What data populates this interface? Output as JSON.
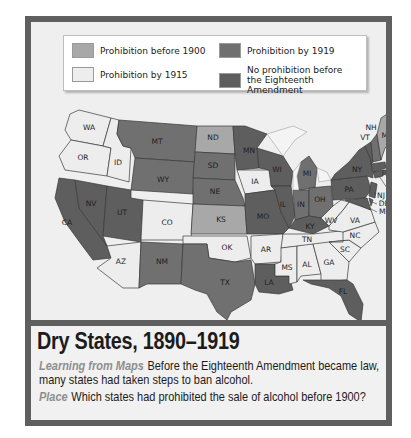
{
  "legend": {
    "items": [
      {
        "label": "Prohibition before 1900",
        "color": "#a8a8a8"
      },
      {
        "label": "Prohibition by 1915",
        "color": "#ededed"
      },
      {
        "label": "Prohibition by 1919",
        "color": "#707070"
      },
      {
        "label": "No prohibition before the Eighteenth Amendment",
        "color": "#5e5e5e"
      }
    ]
  },
  "map": {
    "states": {
      "WA": "Prohibition by 1915",
      "OR": "Prohibition by 1915",
      "ID": "Prohibition by 1915",
      "MT": "Prohibition by 1919",
      "WY": "Prohibition by 1919",
      "UT": "Prohibition by 1919",
      "NV": "No prohibition before the Eighteenth Amendment",
      "CA": "No prohibition before the Eighteenth Amendment",
      "AZ": "Prohibition by 1915",
      "CO": "Prohibition by 1915",
      "NM": "Prohibition by 1919",
      "ND": "Prohibition before 1900",
      "SD": "Prohibition by 1919",
      "NE": "Prohibition by 1919",
      "KS": "Prohibition before 1900",
      "OK": "Prohibition by 1915",
      "TX": "Prohibition by 1919",
      "MN": "No prohibition before the Eighteenth Amendment",
      "IA": "Prohibition by 1915",
      "MO": "No prohibition before the Eighteenth Amendment",
      "AR": "Prohibition by 1915",
      "LA": "No prohibition before the Eighteenth Amendment",
      "WI": "No prohibition before the Eighteenth Amendment",
      "IL": "No prohibition before the Eighteenth Amendment",
      "MI": "Prohibition by 1919",
      "IN": "Prohibition by 1919",
      "OH": "Prohibition by 1919",
      "KY": "No prohibition before the Eighteenth Amendment",
      "TN": "Prohibition by 1915",
      "MS": "Prohibition by 1915",
      "AL": "Prohibition by 1915",
      "GA": "Prohibition by 1915",
      "FL": "No prohibition before the Eighteenth Amendment",
      "SC": "Prohibition by 1915",
      "NC": "Prohibition by 1915",
      "VA": "Prohibition by 1915",
      "WV": "Prohibition by 1915",
      "PA": "No prohibition before the Eighteenth Amendment",
      "NY": "No prohibition before the Eighteenth Amendment",
      "NJ": "No prohibition before the Eighteenth Amendment",
      "DE": "No prohibition before the Eighteenth Amendment",
      "MD": "No prohibition before the Eighteenth Amendment",
      "CT": "No prohibition before the Eighteenth Amendment",
      "RI": "No prohibition before the Eighteenth Amendment",
      "MA": "No prohibition before the Eighteenth Amendment",
      "VT": "No prohibition before the Eighteenth Amendment",
      "NH": "Prohibition by 1919",
      "ME": "Prohibition before 1900"
    },
    "labels": [
      "WA",
      "OR",
      "ID",
      "MT",
      "WY",
      "UT",
      "NV",
      "CA",
      "AZ",
      "CO",
      "NM",
      "ND",
      "SD",
      "NE",
      "KS",
      "OK",
      "TX",
      "MN",
      "IA",
      "MO",
      "AR",
      "LA",
      "WI",
      "IL",
      "MI",
      "IN",
      "OH",
      "KY",
      "TN",
      "MS",
      "AL",
      "GA",
      "FL",
      "SC",
      "NC",
      "VA",
      "WV",
      "PA",
      "NY",
      "NJ",
      "DE",
      "MD",
      "CT",
      "RI",
      "MA",
      "VT",
      "NH",
      "ME"
    ]
  },
  "caption": {
    "title": "Dry States, 1890–1919",
    "learning_keyword": "Learning from Maps",
    "learning_text": "Before the Eighteenth Amendment became law, many states had taken steps to ban alcohol.",
    "place_keyword": "Place",
    "place_text": "Which states had prohibited the sale of alcohol before 1900?"
  }
}
